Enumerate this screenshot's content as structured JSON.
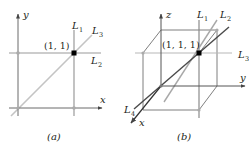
{
  "figure": {
    "panel_a": {
      "caption": "(a)",
      "axes": {
        "x_label": "x",
        "y_label": "y"
      },
      "point_label": "(1, 1)",
      "lines": [
        {
          "name": "L",
          "sub": "1",
          "desc": "vertical line x = 1"
        },
        {
          "name": "L",
          "sub": "2",
          "desc": "horizontal line y = 1"
        },
        {
          "name": "L",
          "sub": "3",
          "desc": "diagonal line y = x"
        }
      ]
    },
    "panel_b": {
      "caption": "(b)",
      "axes": {
        "x_label": "x",
        "y_label": "y",
        "z_label": "z"
      },
      "point_label": "(1, 1, 1)",
      "lines": [
        {
          "name": "L",
          "sub": "1"
        },
        {
          "name": "L",
          "sub": "2"
        },
        {
          "name": "L",
          "sub": "3"
        },
        {
          "name": "L",
          "sub": "4"
        }
      ]
    },
    "colors": {
      "axis": "#555555",
      "gray_line": "#a0a0a0",
      "light_line": "#c8c8c8",
      "dark_line": "#444444",
      "point": "#000000",
      "text": "#231f20"
    }
  }
}
